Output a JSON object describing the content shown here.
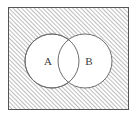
{
  "figure": {
    "type": "venn-diagram",
    "title": "",
    "background_color": "#ffffff"
  },
  "universe": {
    "name": "universal-set-rectangle",
    "label": "",
    "fill_style": "diagonal-hatch",
    "hatch_direction": "forward-slash",
    "hatch_color": "#8c8c8c",
    "hatch_spacing_px": 3,
    "border_color": "#555555",
    "border_width_px": 1,
    "x": 8,
    "y": 7,
    "width": 121,
    "height": 103
  },
  "sets": [
    {
      "id": "set-a",
      "label": "A",
      "cx": 52,
      "cy": 61,
      "r": 27,
      "fill_color": "#ffffff",
      "stroke_color": "#6e6e6e",
      "label_x": 48,
      "label_y": 61
    },
    {
      "id": "set-b",
      "label": "B",
      "cx": 85,
      "cy": 61,
      "r": 27,
      "fill_color": "#ffffff",
      "stroke_color": "#6e6e6e",
      "label_x": 89,
      "label_y": 61
    }
  ],
  "regions": {
    "intersection_fill": "white",
    "outside_circles_fill": "hatched"
  }
}
